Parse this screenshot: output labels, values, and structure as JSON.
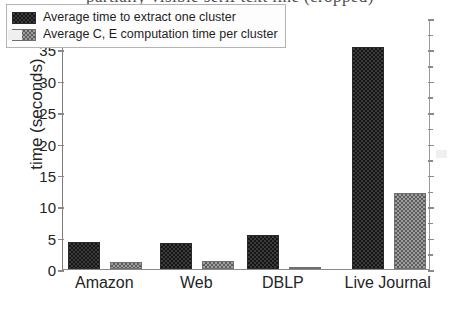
{
  "caption": {
    "cut_off_line": "partially visible serif text line (cropped)"
  },
  "chart_data": {
    "type": "bar",
    "title": "",
    "xlabel": "",
    "ylabel": "time (seconds)",
    "categories": [
      "Amazon",
      "Web",
      "DBLP",
      "Live Journal"
    ],
    "series": [
      {
        "name": "Average time to extract one cluster",
        "values": [
          4.3,
          4.2,
          5.4,
          35.4
        ],
        "color": "#2a2a2a",
        "pattern": "checkered-dark"
      },
      {
        "name": "Average C, E computation time per cluster",
        "values": [
          1.1,
          1.2,
          0.3,
          12.1
        ],
        "color": "#9e9e9e",
        "pattern": "checkered-light"
      }
    ],
    "ylim": [
      0,
      40
    ],
    "yticks": [
      0,
      5,
      10,
      15,
      20,
      25,
      30,
      35,
      40
    ],
    "ytick_labels": [
      "0",
      "5",
      "10",
      "15",
      "20",
      "25",
      "30",
      "35",
      "40"
    ],
    "grid": false,
    "legend_position": "upper-left"
  }
}
